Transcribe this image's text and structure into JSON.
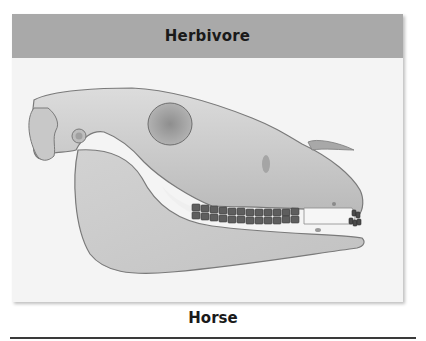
{
  "panel": {
    "title": "Herbivore",
    "header_color": "#a9a9a9",
    "background_color": "#f4f4f4"
  },
  "illustration": {
    "subject": "horse-skull",
    "description": "Lateral view of a horse skull showing large jaw, eye socket, flat grinding molars and front incisors"
  },
  "caption": {
    "label": "Horse"
  }
}
